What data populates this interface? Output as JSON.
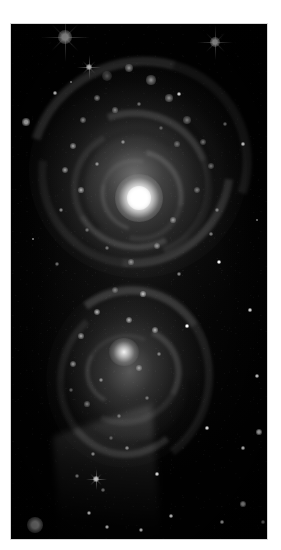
{
  "page": {
    "background_color": "#ffffff",
    "width": 281,
    "height": 550
  },
  "caption_sliver": {
    "note": "bottom pixel rows of a printed caption line, clipped by the crop and illegible",
    "line_left_text": "—— ——— ———— ————— —— ————",
    "line_right_text": "——— —— ————— ——",
    "color": "#8e8e8e"
  },
  "photo": {
    "name": "interacting-spiral-galaxies-plate",
    "subject": "Pair of colliding / interacting spiral galaxies",
    "frame": {
      "x": 11,
      "y": 24,
      "width": 256,
      "height": 515
    },
    "background_color": "#010101",
    "highlight_color": "#ffffff",
    "nebulosity_color": "#9a9a9a",
    "dust_lane_color": "#000000",
    "palette": "monochrome grayscale",
    "features": [
      {
        "name": "upper-galaxy-disc",
        "label": "Large foreground spiral galaxy with open, knotty arms"
      },
      {
        "name": "upper-galaxy-nucleus",
        "label": "Bright saturated nucleus of the upper spiral"
      },
      {
        "name": "lower-galaxy-disc",
        "label": "Smaller companion spiral galaxy below"
      },
      {
        "name": "lower-galaxy-nucleus",
        "label": "Compact nucleus of the companion spiral"
      },
      {
        "name": "tidal-tail",
        "label": "Tidal tail streaming toward lower left"
      },
      {
        "name": "foreground-stars",
        "label": "Foreground field stars with diffraction spikes"
      },
      {
        "name": "hii-knots",
        "label": "Bright star-forming knots strung along the spiral arms"
      },
      {
        "name": "dust-lanes",
        "label": "Dark dust lanes tracing the arms"
      }
    ],
    "stars": [
      {
        "x": 54,
        "y": 13,
        "r": 7.0,
        "spikes": true
      },
      {
        "x": 204,
        "y": 18,
        "r": 5.0,
        "spikes": true
      },
      {
        "x": 78,
        "y": 43,
        "r": 3.4,
        "spikes": true
      },
      {
        "x": 15,
        "y": 98,
        "r": 3.6,
        "spikes": false
      },
      {
        "x": 44,
        "y": 69,
        "r": 1.6,
        "spikes": false
      },
      {
        "x": 60,
        "y": 58,
        "r": 1.4,
        "spikes": false
      },
      {
        "x": 168,
        "y": 70,
        "r": 1.8,
        "spikes": false
      },
      {
        "x": 232,
        "y": 120,
        "r": 1.6,
        "spikes": false
      },
      {
        "x": 246,
        "y": 196,
        "r": 1.4,
        "spikes": false
      },
      {
        "x": 208,
        "y": 238,
        "r": 1.8,
        "spikes": false
      },
      {
        "x": 239,
        "y": 286,
        "r": 1.6,
        "spikes": false
      },
      {
        "x": 22,
        "y": 215,
        "r": 1.4,
        "spikes": false
      },
      {
        "x": 176,
        "y": 302,
        "r": 1.6,
        "spikes": false
      },
      {
        "x": 246,
        "y": 352,
        "r": 1.8,
        "spikes": false
      },
      {
        "x": 196,
        "y": 404,
        "r": 1.6,
        "spikes": false
      },
      {
        "x": 85,
        "y": 455,
        "r": 3.0,
        "spikes": true
      },
      {
        "x": 146,
        "y": 450,
        "r": 1.6,
        "spikes": false
      },
      {
        "x": 232,
        "y": 424,
        "r": 1.6,
        "spikes": false
      },
      {
        "x": 248,
        "y": 408,
        "r": 2.6,
        "spikes": false
      },
      {
        "x": 24,
        "y": 501,
        "r": 8.0,
        "spikes": false
      },
      {
        "x": 78,
        "y": 489,
        "r": 2.2,
        "spikes": false
      },
      {
        "x": 96,
        "y": 503,
        "r": 2.2,
        "spikes": false
      },
      {
        "x": 160,
        "y": 492,
        "r": 1.8,
        "spikes": false
      },
      {
        "x": 130,
        "y": 506,
        "r": 2.4,
        "spikes": false
      },
      {
        "x": 232,
        "y": 480,
        "r": 2.6,
        "spikes": false
      },
      {
        "x": 211,
        "y": 498,
        "r": 1.6,
        "spikes": false
      },
      {
        "x": 252,
        "y": 498,
        "r": 1.6,
        "spikes": false
      }
    ],
    "knots": [
      {
        "x": 96,
        "y": 52,
        "r": 5.0
      },
      {
        "x": 118,
        "y": 44,
        "r": 4.0
      },
      {
        "x": 140,
        "y": 56,
        "r": 4.6
      },
      {
        "x": 158,
        "y": 74,
        "r": 3.6
      },
      {
        "x": 86,
        "y": 74,
        "r": 3.4
      },
      {
        "x": 72,
        "y": 96,
        "r": 3.0
      },
      {
        "x": 104,
        "y": 86,
        "r": 2.6
      },
      {
        "x": 128,
        "y": 80,
        "r": 2.4
      },
      {
        "x": 176,
        "y": 96,
        "r": 3.8
      },
      {
        "x": 192,
        "y": 118,
        "r": 3.2
      },
      {
        "x": 200,
        "y": 142,
        "r": 2.8
      },
      {
        "x": 186,
        "y": 166,
        "r": 3.4
      },
      {
        "x": 166,
        "y": 120,
        "r": 2.6
      },
      {
        "x": 150,
        "y": 104,
        "r": 2.4
      },
      {
        "x": 62,
        "y": 122,
        "r": 2.8
      },
      {
        "x": 54,
        "y": 146,
        "r": 3.0
      },
      {
        "x": 70,
        "y": 166,
        "r": 2.6
      },
      {
        "x": 50,
        "y": 186,
        "r": 2.4
      },
      {
        "x": 86,
        "y": 140,
        "r": 2.2
      },
      {
        "x": 112,
        "y": 118,
        "r": 2.0
      },
      {
        "x": 206,
        "y": 186,
        "r": 2.4
      },
      {
        "x": 162,
        "y": 196,
        "r": 2.6
      },
      {
        "x": 146,
        "y": 222,
        "r": 3.2
      },
      {
        "x": 120,
        "y": 238,
        "r": 2.6
      },
      {
        "x": 96,
        "y": 224,
        "r": 2.4
      },
      {
        "x": 76,
        "y": 206,
        "r": 2.2
      },
      {
        "x": 104,
        "y": 266,
        "r": 3.0
      },
      {
        "x": 132,
        "y": 270,
        "r": 2.6
      },
      {
        "x": 86,
        "y": 288,
        "r": 3.4
      },
      {
        "x": 118,
        "y": 296,
        "r": 3.0
      },
      {
        "x": 144,
        "y": 306,
        "r": 2.8
      },
      {
        "x": 70,
        "y": 312,
        "r": 2.6
      },
      {
        "x": 62,
        "y": 340,
        "r": 3.0
      },
      {
        "x": 90,
        "y": 356,
        "r": 2.4
      },
      {
        "x": 128,
        "y": 344,
        "r": 2.8
      },
      {
        "x": 148,
        "y": 330,
        "r": 2.4
      },
      {
        "x": 76,
        "y": 380,
        "r": 2.6
      },
      {
        "x": 108,
        "y": 392,
        "r": 2.4
      },
      {
        "x": 136,
        "y": 374,
        "r": 2.2
      },
      {
        "x": 60,
        "y": 366,
        "r": 2.0
      },
      {
        "x": 100,
        "y": 414,
        "r": 2.2
      },
      {
        "x": 82,
        "y": 430,
        "r": 2.0
      },
      {
        "x": 116,
        "y": 424,
        "r": 1.8
      },
      {
        "x": 66,
        "y": 452,
        "r": 2.0
      },
      {
        "x": 92,
        "y": 466,
        "r": 1.8
      },
      {
        "x": 168,
        "y": 250,
        "r": 2.0
      },
      {
        "x": 214,
        "y": 100,
        "r": 2.2
      },
      {
        "x": 200,
        "y": 210,
        "r": 1.8
      },
      {
        "x": 46,
        "y": 240,
        "r": 2.0
      }
    ]
  }
}
